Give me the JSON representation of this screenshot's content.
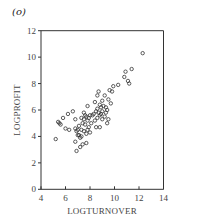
{
  "panel_label": "(o)",
  "chart_data": {
    "type": "scatter",
    "title": "",
    "xlabel": "LOGTURNOVER",
    "ylabel": "LOGPROFIT",
    "xlim": [
      4,
      14
    ],
    "ylim": [
      0,
      12
    ],
    "xticks": [
      4,
      6,
      8,
      10,
      12,
      14
    ],
    "yticks": [
      0,
      2,
      4,
      6,
      8,
      10,
      12
    ],
    "grid": false,
    "legend": null,
    "marker": "open-circle",
    "points": [
      [
        12.3,
        10.3
      ],
      [
        11.4,
        9.1
      ],
      [
        10.9,
        8.9
      ],
      [
        10.8,
        8.5
      ],
      [
        11.1,
        8.2
      ],
      [
        11.2,
        8.0
      ],
      [
        10.3,
        7.9
      ],
      [
        9.9,
        7.8
      ],
      [
        9.6,
        7.5
      ],
      [
        9.8,
        7.4
      ],
      [
        8.7,
        7.4
      ],
      [
        8.6,
        7.1
      ],
      [
        9.2,
        7.1
      ],
      [
        9.5,
        6.8
      ],
      [
        9.0,
        6.7
      ],
      [
        9.7,
        6.5
      ],
      [
        8.4,
        6.6
      ],
      [
        8.8,
        6.4
      ],
      [
        9.1,
        6.3
      ],
      [
        9.3,
        6.2
      ],
      [
        8.6,
        6.1
      ],
      [
        7.8,
        6.3
      ],
      [
        9.4,
        6.0
      ],
      [
        9.0,
        5.9
      ],
      [
        8.5,
        5.9
      ],
      [
        8.7,
        5.8
      ],
      [
        8.9,
        5.7
      ],
      [
        8.3,
        5.7
      ],
      [
        8.2,
        5.6
      ],
      [
        8.0,
        5.6
      ],
      [
        8.8,
        5.6
      ],
      [
        9.2,
        5.5
      ],
      [
        9.5,
        5.3
      ],
      [
        8.6,
        5.4
      ],
      [
        9.0,
        5.3
      ],
      [
        7.5,
        5.8
      ],
      [
        7.6,
        5.6
      ],
      [
        7.7,
        5.5
      ],
      [
        7.3,
        5.4
      ],
      [
        7.5,
        5.3
      ],
      [
        7.8,
        5.2
      ],
      [
        7.4,
        5.0
      ],
      [
        7.6,
        4.9
      ],
      [
        6.8,
        5.3
      ],
      [
        6.6,
        5.9
      ],
      [
        6.2,
        5.7
      ],
      [
        5.8,
        5.4
      ],
      [
        5.4,
        5.1
      ],
      [
        5.5,
        5.0
      ],
      [
        5.6,
        4.9
      ],
      [
        6.0,
        4.6
      ],
      [
        6.3,
        4.5
      ],
      [
        6.8,
        4.6
      ],
      [
        6.9,
        4.4
      ],
      [
        7.1,
        4.8
      ],
      [
        7.3,
        4.5
      ],
      [
        7.5,
        4.4
      ],
      [
        7.9,
        4.7
      ],
      [
        7.8,
        4.5
      ],
      [
        8.0,
        4.3
      ],
      [
        7.7,
        4.2
      ],
      [
        7.1,
        4.1
      ],
      [
        7.3,
        4.0
      ],
      [
        7.2,
        3.9
      ],
      [
        8.5,
        4.7
      ],
      [
        8.8,
        4.7
      ],
      [
        9.4,
        5.0
      ],
      [
        6.8,
        3.6
      ],
      [
        7.2,
        3.2
      ],
      [
        7.4,
        3.4
      ],
      [
        7.7,
        3.5
      ],
      [
        6.9,
        2.9
      ],
      [
        5.2,
        3.8
      ],
      [
        7.0,
        4.1
      ],
      [
        8.1,
        5.0
      ],
      [
        7.9,
        5.4
      ],
      [
        8.4,
        5.2
      ],
      [
        7.0,
        4.5
      ],
      [
        8.9,
        6.2
      ],
      [
        9.3,
        5.8
      ]
    ]
  }
}
